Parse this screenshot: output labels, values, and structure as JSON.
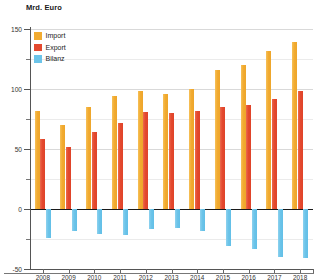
{
  "chart_data": {
    "type": "bar",
    "title": "Mrd. Euro",
    "xlabel": "",
    "ylabel": "Mrd. Euro",
    "ylim": [
      -50,
      150
    ],
    "yticks": [
      -50,
      0,
      50,
      100,
      150
    ],
    "yminorticks": [
      -25,
      25,
      75,
      125
    ],
    "grid": true,
    "legend_position": "top-left",
    "categories": [
      "2008",
      "2009",
      "2010",
      "2011",
      "2012",
      "2013",
      "2014",
      "2015",
      "2016",
      "2017",
      "2018"
    ],
    "series": [
      {
        "name": "Import",
        "color": "#F2AB30",
        "values": [
          82,
          70,
          85,
          94,
          98,
          96,
          100,
          116,
          120,
          132,
          139
        ]
      },
      {
        "name": "Export",
        "color": "#E4492F",
        "values": [
          58,
          52,
          64,
          72,
          81,
          80,
          82,
          85,
          87,
          92,
          98
        ]
      },
      {
        "name": "Bilanz",
        "color": "#6CC4E9",
        "values": [
          -24,
          -18,
          -21,
          -22,
          -17,
          -16,
          -18,
          -31,
          -33,
          -40,
          -41
        ]
      }
    ]
  },
  "axis": {
    "title": "Mrd. Euro",
    "tick_labels_y": [
      "150",
      "100",
      "50",
      "0",
      "-50"
    ],
    "tick_labels_x": [
      "2008",
      "2009",
      "2010",
      "2011",
      "2012",
      "2013",
      "2014",
      "2015",
      "2016",
      "2017",
      "2018"
    ]
  },
  "legend": {
    "items": [
      {
        "label": "Import",
        "color": "#F2AB30"
      },
      {
        "label": "Export",
        "color": "#E4492F"
      },
      {
        "label": "Bilanz",
        "color": "#6CC4E9"
      }
    ]
  }
}
